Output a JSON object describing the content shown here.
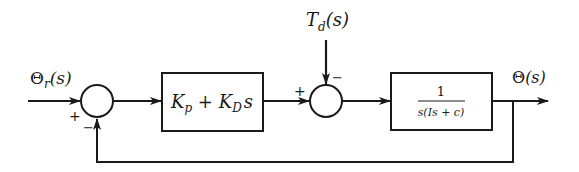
{
  "diagram": {
    "type": "feedback-control-block-diagram",
    "colors": {
      "line": "#1a1a1a",
      "background": "#ffffff"
    },
    "signals": {
      "input": {
        "symbol": "Θ",
        "subscript": "r",
        "arg": "(s)"
      },
      "disturbance": {
        "symbol": "T",
        "subscript": "d",
        "arg": "(s)"
      },
      "output": {
        "symbol": "Θ",
        "arg": "(s)"
      }
    },
    "blocks": [
      {
        "id": "controller",
        "term1": "K",
        "sub1": "p",
        "op": " + ",
        "term2": "K",
        "sub2": "D",
        "tail": "s"
      },
      {
        "id": "plant",
        "numerator": "1",
        "denominator": "s(Is + c)"
      }
    ],
    "summing_junctions": [
      {
        "id": "error-junction",
        "left_sign": "+",
        "bottom_sign": "−"
      },
      {
        "id": "disturbance-junction",
        "left_sign": "+",
        "top_sign": "−"
      }
    ]
  }
}
